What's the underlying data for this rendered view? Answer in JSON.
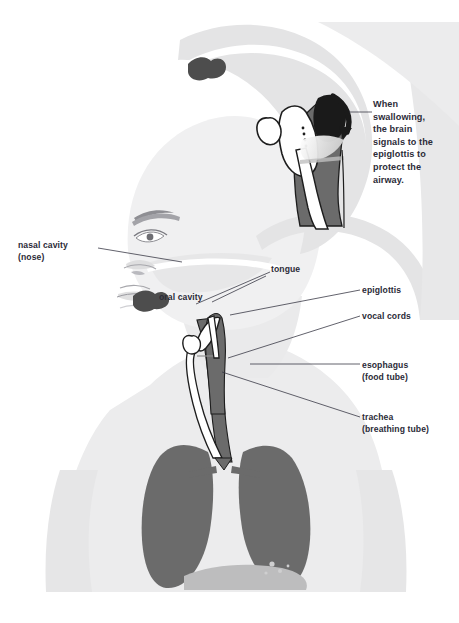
{
  "diagram": {
    "colors": {
      "background": "#ffffff",
      "body_silhouette_light": "#ececed",
      "body_silhouette_mid": "#e2e2e3",
      "organ_gray": "#6b6b6b",
      "organ_gray_dark": "#545454",
      "tongue_dark": "#4d4d4d",
      "epiglottis_black": "#1a1a1a",
      "outline": "#1d1d1d",
      "label_text": "#2b2b38",
      "leader_line": "#3a3a46",
      "inner_light": "#ffffff",
      "highlight_band": "#d9d9d9"
    }
  },
  "labels": {
    "callout": "When\nswallowing,\nthe brain\nsignals to the\nepiglottis to\nprotect the\nairway.",
    "nasal_cavity": "nasal cavity\n(nose)",
    "tongue": "tongue",
    "oral_cavity": "oral cavity",
    "epiglottis": "epiglottis",
    "vocal_cords": "vocal cords",
    "esophagus": "esophagus\n(food tube)",
    "trachea": "trachea\n(breathing tube)"
  },
  "icons": {
    "swallow_arrow": "curved-arrow-icon",
    "leader_line": "leader-line-icon"
  },
  "parts": [
    {
      "id": "inset-detail",
      "name": "throat-inset-detail",
      "description": "magnified larynx cross-section showing epiglottis closing"
    },
    {
      "id": "head-profile",
      "name": "head-profile",
      "description": "side profile of head with eye, nose and lips"
    },
    {
      "id": "tongue-shape",
      "name": "tongue-shape",
      "description": "dark tongue silhouette inside oral cavity"
    },
    {
      "id": "throat-main",
      "name": "throat-cross-section",
      "description": "main larynx, trachea and esophagus cross-section"
    },
    {
      "id": "lung-left",
      "name": "lung-left",
      "description": "left lung lobe"
    },
    {
      "id": "lung-right",
      "name": "lung-right",
      "description": "right lung lobe"
    },
    {
      "id": "diaphragm",
      "name": "diaphragm-stomach",
      "description": "faint diaphragm / stomach shape below lungs"
    },
    {
      "id": "torso",
      "name": "torso-silhouette",
      "description": "light gray body outline of head, neck, shoulders and chest"
    }
  ]
}
